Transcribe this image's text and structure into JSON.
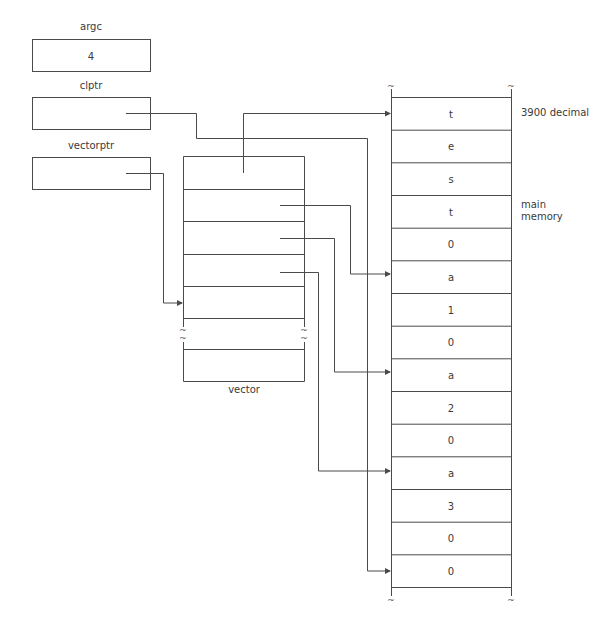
{
  "variables": {
    "argc": {
      "label": "argc",
      "value": "4"
    },
    "clptr": {
      "label": "clptr",
      "value": ""
    },
    "vectorptr": {
      "label": "vectorptr",
      "value": ""
    }
  },
  "vector": {
    "label": "vector",
    "break_symbol": "~"
  },
  "memory": {
    "label_line1": "main",
    "label_line2": "memory",
    "address_label": "3900 decimal",
    "break_symbol": "~",
    "cells": [
      "t",
      "e",
      "s",
      "t",
      "0",
      "a",
      "1",
      "0",
      "a",
      "2",
      "0",
      "a",
      "3",
      "0",
      "0"
    ]
  },
  "colors": {
    "line": "#4a4a4a",
    "text": "#3a3a3a",
    "background": "#ffffff"
  }
}
